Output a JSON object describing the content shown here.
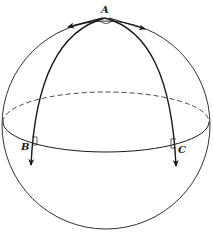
{
  "diagram": {
    "type": "spherical-triangle",
    "labels": {
      "apex": "A",
      "left_base": "B",
      "right_base": "C"
    },
    "colors": {
      "stroke": "#1a1a1a",
      "background": "#ffffff"
    }
  }
}
